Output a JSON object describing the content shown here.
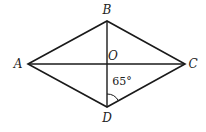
{
  "diagram": {
    "type": "rhombus",
    "vertices": {
      "A": {
        "label": "A",
        "x": 28,
        "y": 64
      },
      "B": {
        "label": "B",
        "x": 107,
        "y": 21
      },
      "C": {
        "label": "C",
        "x": 185,
        "y": 64
      },
      "D": {
        "label": "D",
        "x": 107,
        "y": 107
      }
    },
    "intersection": {
      "label": "O",
      "x": 107,
      "y": 64
    },
    "angle_mark": {
      "vertex": "D",
      "between": [
        "O",
        "C"
      ],
      "value": "65°"
    },
    "line_color": "#1a1a1a"
  }
}
